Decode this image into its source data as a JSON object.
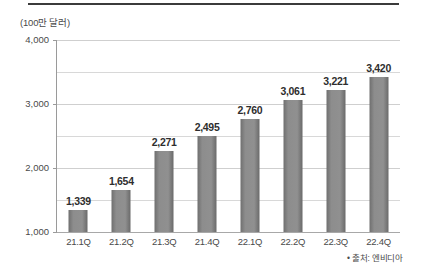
{
  "chart_data": {
    "type": "bar",
    "title": "",
    "subtitle": "",
    "unit_label": "(100만 달러)",
    "xlabel": "",
    "ylabel": "",
    "categories": [
      "21.1Q",
      "21.2Q",
      "21.3Q",
      "21.4Q",
      "22.1Q",
      "22.2Q",
      "22.3Q",
      "22.4Q"
    ],
    "values": [
      1339,
      1654,
      2271,
      2495,
      2760,
      3061,
      3221,
      3420
    ],
    "value_labels": [
      "1,339",
      "1,654",
      "2,271",
      "2,495",
      "2,760",
      "3,061",
      "3,221",
      "3,420"
    ],
    "ylim": [
      1000,
      4000
    ],
    "ytick_labels": [
      "1,000",
      "2,000",
      "3,000",
      "4,000"
    ],
    "ytick_values": [
      1000,
      2000,
      3000,
      4000
    ],
    "gridline_values": [
      1500,
      2000,
      2500,
      3000,
      3500,
      4000
    ],
    "grid": true,
    "legend": "none",
    "bar_color": "#8a8a8a",
    "gridline_color": "#d8d8d8",
    "axis_color": "#9a9a9a",
    "text_color": "#3a3a3a",
    "source_note": "• 출처: 엔비디아"
  }
}
